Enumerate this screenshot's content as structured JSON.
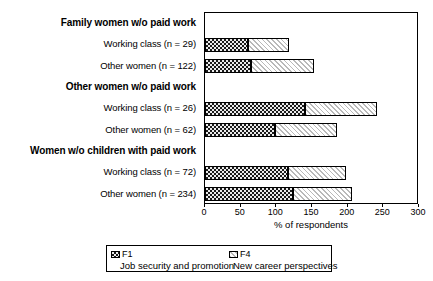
{
  "chart_data": {
    "type": "bar",
    "orientation": "horizontal",
    "stacked": true,
    "title": "",
    "xlabel": "% of respondents",
    "ylabel": "",
    "xlim": [
      0,
      300
    ],
    "xticks": [
      0,
      50,
      100,
      150,
      200,
      250,
      300
    ],
    "grid": false,
    "legend_position": "bottom",
    "categories": [
      "Family women w/o paid work",
      "Working class (n = 29)",
      "Other women (n = 122)",
      "Other women w/o paid work",
      "Working class (n = 26)",
      "Other women (n = 62)",
      "Women w/o children with paid work",
      "Working class (n = 72)",
      "Other women (n = 234)"
    ],
    "category_kinds": [
      "group",
      "bar",
      "bar",
      "group",
      "bar",
      "bar",
      "group",
      "bar",
      "bar"
    ],
    "series": [
      {
        "name": "F1",
        "description": "Job security and promotion",
        "key": "f1",
        "values": [
          null,
          60,
          65,
          null,
          140,
          98,
          null,
          116,
          123
        ]
      },
      {
        "name": "F4",
        "description": "New career perspectives",
        "key": "f4",
        "values": [
          null,
          58,
          88,
          null,
          101,
          87,
          null,
          82,
          83
        ]
      }
    ],
    "totals": [
      null,
      118,
      153,
      null,
      241,
      185,
      null,
      198,
      206
    ]
  },
  "legend": {
    "entries": [
      {
        "name": "F1",
        "description": "Job security and promotion"
      },
      {
        "name": "F4",
        "description": "New career perspectives"
      }
    ]
  },
  "axis": {
    "xlabel": "% of respondents",
    "tick_labels": [
      "0",
      "50",
      "100",
      "150",
      "200",
      "250",
      "300"
    ]
  },
  "colors": {
    "f1_fill": "#1a1a1a",
    "f4_fill": "#ffffff",
    "f4_hatch": "#b9b9b9",
    "frame": "#000000",
    "text": "#000000",
    "background": "#ffffff"
  }
}
